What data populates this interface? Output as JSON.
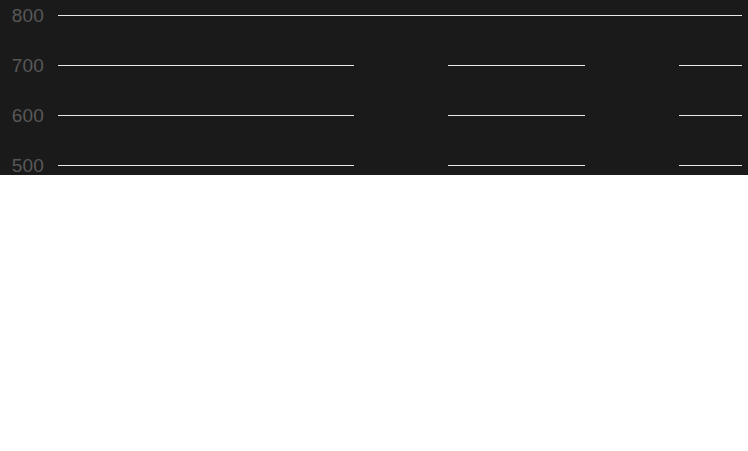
{
  "chart_data": {
    "type": "bar",
    "title": "",
    "subtitle": "",
    "xlabel": "",
    "ylabel": "",
    "categories": [
      "2008",
      "2009",
      "2010"
    ],
    "values": [
      350,
      474,
      772
    ],
    "series": [
      {
        "name": "",
        "values": [
          350,
          474,
          772
        ]
      }
    ],
    "ylim": [
      0,
      800
    ],
    "y_ticks": [
      0,
      100,
      200,
      300,
      400,
      500,
      600,
      700,
      800
    ],
    "y_tick_labels": [
      "0",
      "100",
      "200",
      "300",
      "400",
      "500",
      "600",
      "700",
      "800"
    ],
    "x_tick_labels": [
      "2008",
      "2009",
      "2010"
    ],
    "grid": "horizontal",
    "legend": "none",
    "annotations": [],
    "colors": {
      "bar": "#1a1a1a",
      "background": "#ffffff",
      "gridline": "#e9e9e9",
      "axis_line": "#dcdcdc",
      "tick_label": "#585858"
    }
  },
  "axes": {
    "y_labels": [
      {
        "text": "800",
        "value": 800
      },
      {
        "text": "700",
        "value": 700
      },
      {
        "text": "600",
        "value": 600
      },
      {
        "text": "500",
        "value": 500
      },
      {
        "text": "400",
        "value": 400
      },
      {
        "text": "300",
        "value": 300
      },
      {
        "text": "200",
        "value": 200
      },
      {
        "text": "100",
        "value": 100
      },
      {
        "text": "0",
        "value": 0
      }
    ],
    "x_labels": [
      {
        "text": "2008"
      },
      {
        "text": "2009"
      },
      {
        "text": "2010"
      }
    ]
  },
  "bars": [
    {
      "category": "2008",
      "value": 350
    },
    {
      "category": "2009",
      "value": 474
    },
    {
      "category": "2010",
      "value": 772
    }
  ]
}
